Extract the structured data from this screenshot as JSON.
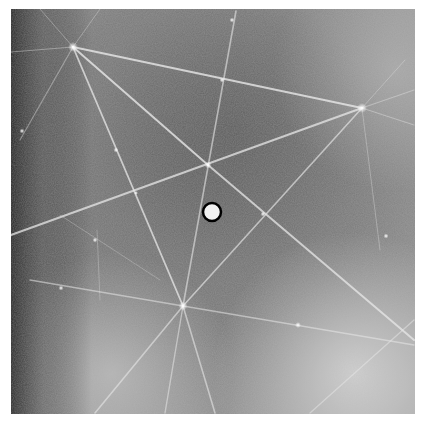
{
  "figure": {
    "background_colors": {
      "dark": "#5a5a5a",
      "mid": "#7d7d7d",
      "light": "#b8b8b8",
      "edge_dark": "#2a2a2a"
    },
    "line_color": "#e6e6e6",
    "poles": [
      {
        "x": 73,
        "y": 47
      },
      {
        "x": 362,
        "y": 108
      },
      {
        "x": 183,
        "y": 306
      },
      {
        "x": 208,
        "y": 165
      }
    ],
    "beam_stop": {
      "x": 212,
      "y": 212,
      "r": 10,
      "fill": "#f2f2f2",
      "stroke": "#000000"
    }
  }
}
